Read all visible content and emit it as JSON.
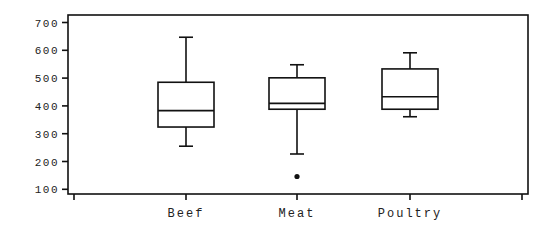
{
  "chart_data": {
    "type": "box",
    "title": "",
    "xlabel": "",
    "ylabel": "",
    "ylim": [
      100,
      700
    ],
    "yticks": [
      100,
      200,
      300,
      400,
      500,
      600,
      700
    ],
    "ytick_labels": [
      "100",
      "200",
      "300",
      "400",
      "500",
      "600",
      "700"
    ],
    "categories": [
      "Beef",
      "Meat",
      "Poultry"
    ],
    "grid": false,
    "legend": null,
    "boxes": [
      {
        "category": "Beef",
        "whisker_low": 255,
        "q1": 324,
        "median": 383,
        "q3": 485,
        "whisker_high": 647,
        "outliers": []
      },
      {
        "category": "Meat",
        "whisker_low": 227,
        "q1": 388,
        "median": 409,
        "q3": 501,
        "whisker_high": 548,
        "outliers": [
          146
        ]
      },
      {
        "category": "Poultry",
        "whisker_low": 361,
        "q1": 388,
        "median": 433,
        "q3": 533,
        "whisker_high": 591,
        "outliers": []
      }
    ]
  }
}
